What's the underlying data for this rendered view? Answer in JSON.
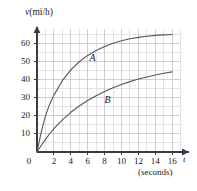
{
  "chart_data": {
    "type": "line",
    "title": "",
    "xlabel": "t",
    "xlabel_units": "(seconds)",
    "ylabel": "v (mi/h)",
    "ylabel_var": "v",
    "ylabel_units": "(mi/h)",
    "xlim": [
      0,
      17.5
    ],
    "ylim": [
      0,
      70
    ],
    "xticks": [
      0,
      2,
      4,
      6,
      8,
      10,
      12,
      14,
      16
    ],
    "yticks": [
      10,
      20,
      30,
      40,
      50,
      60
    ],
    "xtick_labels": [
      "0",
      "2",
      "4",
      "6",
      "8",
      "10",
      "12",
      "14",
      "16"
    ],
    "ytick_labels": [
      "10",
      "20",
      "30",
      "40",
      "50",
      "60"
    ],
    "grid": true,
    "grid_minor_step_x": 1,
    "grid_minor_step_y": 5,
    "grid_major_step_x": 2,
    "grid_major_step_y": 10,
    "grid_color": "#d9d9de",
    "grid_major_color": "#c2c2c9",
    "axis_color": "#3b3b46",
    "curve_color": "#55555f",
    "legend": "inline-labels",
    "series": [
      {
        "name": "A",
        "label": "A",
        "label_x": 6.2,
        "label_y": 52,
        "x": [
          0,
          0.5,
          1,
          1.5,
          2,
          3,
          4,
          5,
          6,
          7,
          8,
          9,
          10,
          11,
          12,
          13,
          14,
          15,
          16
        ],
        "y": [
          0,
          11,
          20,
          26.5,
          31.5,
          39.5,
          45.5,
          50,
          53.5,
          56.2,
          58.4,
          60.2,
          61.6,
          62.7,
          63.5,
          64.1,
          64.6,
          64.9,
          65.1
        ]
      },
      {
        "name": "B",
        "label": "B",
        "label_x": 8.0,
        "label_y": 29,
        "x": [
          0,
          0.5,
          1,
          1.5,
          2,
          3,
          4,
          5,
          6,
          7,
          8,
          9,
          10,
          11,
          12,
          13,
          14,
          15,
          16
        ],
        "y": [
          0,
          3.6,
          7,
          10.1,
          12.9,
          17.8,
          22,
          25.5,
          28.5,
          31.2,
          33.5,
          35.6,
          37.4,
          39,
          40.4,
          41.6,
          42.7,
          43.6,
          44.4
        ]
      }
    ]
  },
  "axes": {
    "y_axis_title": "v (mi/h)",
    "x_axis_title": "t",
    "x_axis_units": "(seconds)"
  }
}
